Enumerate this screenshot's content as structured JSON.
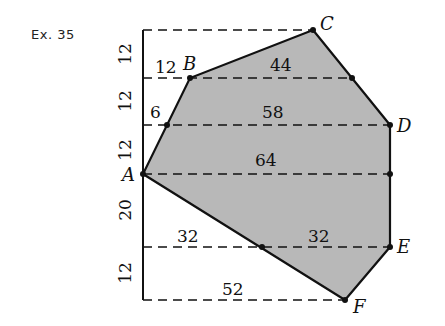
{
  "title": "Ex. 35",
  "colors": {
    "fill": "#b8b8b8",
    "line": "#111111"
  },
  "vertices": {
    "A": "A",
    "B": "B",
    "C": "C",
    "D": "D",
    "E": "E",
    "F": "F"
  },
  "heights": [
    "12",
    "12",
    "12",
    "20",
    "12"
  ],
  "widths": {
    "w1": "12",
    "w2": "44",
    "w3": "6",
    "w4": "58",
    "w5": "64",
    "w6": "32",
    "w7": "32",
    "w8": "52"
  }
}
